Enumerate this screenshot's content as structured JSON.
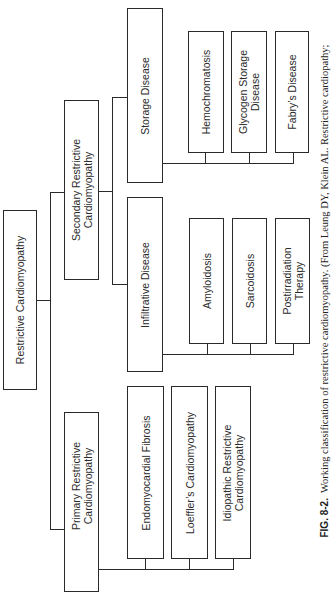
{
  "diagram": {
    "orientation": "rotated -90deg (text reads bottom to top)",
    "root": {
      "label": "Restrictive Cardiomyopathy"
    },
    "branches": [
      {
        "label": "Primary Restrictive Cardiomyopathy",
        "line1": "Primary Restrictive",
        "line2": "Cardiomyopathy",
        "children": [
          {
            "label": "Endomyocardial Fibrosis"
          },
          {
            "label": "Loeffler’s Cardiomyopathy"
          },
          {
            "label": "Idiopathic Restrictive Cardiomyopathy",
            "line1": "Idiopathic Restrictive",
            "line2": "Cardiomyopathy"
          }
        ]
      },
      {
        "label": "Secondary Restrictive Cardiomyopathy",
        "line1": "Secondary Restrictive",
        "line2": "Cardiomyopathy",
        "children": [
          {
            "label": "Infiltrative Disease",
            "children": [
              {
                "label": "Amyloidosis"
              },
              {
                "label": "Sarcoidosis"
              },
              {
                "label": "Postirradiation Therapy",
                "line1": "Postirradiation",
                "line2": "Therapy"
              }
            ]
          },
          {
            "label": "Storage Disease",
            "children": [
              {
                "label": "Hemochromatosis"
              },
              {
                "label": "Glycogen Storage Disease",
                "line1": "Glycogen Storage",
                "line2": "Disease"
              },
              {
                "label": "Fabry’s Disease"
              }
            ]
          }
        ]
      }
    ]
  },
  "caption": {
    "fig_label": "FIG. 8-2.",
    "text": "Working classification of restrictive cardiomyopathy. (From Leung DY, Klein AL. Restrictive cardiopathy;"
  }
}
